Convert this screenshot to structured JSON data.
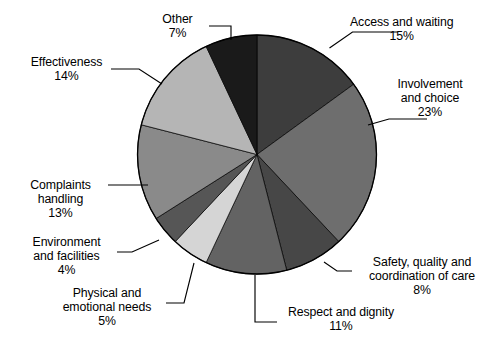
{
  "chart_data": {
    "type": "pie",
    "title": "",
    "subtitle": "",
    "xlabel": "",
    "ylabel": "",
    "legend_position": "none",
    "labels_position": "outside-with-leader-lines",
    "grid": false,
    "start_angle_deg": 0,
    "direction": "clockwise",
    "units": "percent",
    "total": 100,
    "categories": [
      "Access and waiting",
      "Involvement and choice",
      "Safety, quality and coordination of care",
      "Respect and dignity",
      "Physical and emotional needs",
      "Environment and facilities",
      "Complaints handling",
      "Effectiveness",
      "Other"
    ],
    "values": [
      15,
      23,
      8,
      11,
      5,
      4,
      13,
      14,
      7
    ],
    "colors": [
      "#3d3d3d",
      "#6e6e6e",
      "#474747",
      "#636363",
      "#d5d5d5",
      "#565656",
      "#8a8a8a",
      "#b5b5b5",
      "#1a1a1a"
    ],
    "slices": [
      {
        "label": "Access and waiting",
        "value": 15,
        "value_text": "15%",
        "color": "#3d3d3d"
      },
      {
        "label": "Involvement and choice",
        "value": 23,
        "value_text": "23%",
        "color": "#6e6e6e"
      },
      {
        "label": "Safety, quality and coordination of care",
        "value": 8,
        "value_text": "8%",
        "color": "#474747"
      },
      {
        "label": "Respect and dignity",
        "value": 11,
        "value_text": "11%",
        "color": "#636363"
      },
      {
        "label": "Physical and emotional needs",
        "value": 5,
        "value_text": "5%",
        "color": "#d5d5d5"
      },
      {
        "label": "Environment and facilities",
        "value": 4,
        "value_text": "4%",
        "color": "#565656"
      },
      {
        "label": "Complaints handling",
        "value": 13,
        "value_text": "13%",
        "color": "#8a8a8a"
      },
      {
        "label": "Effectiveness",
        "value": 14,
        "value_text": "14%",
        "color": "#b5b5b5"
      },
      {
        "label": "Other",
        "value": 7,
        "value_text": "7%",
        "color": "#1a1a1a"
      }
    ]
  },
  "labels": {
    "access": {
      "line1": "Access and waiting",
      "pct": "15%"
    },
    "involvement": {
      "line1": "Involvement",
      "line2": "and choice",
      "pct": "23%"
    },
    "safety": {
      "line1": "Safety, quality and",
      "line2": "coordination of care",
      "pct": "8%"
    },
    "respect": {
      "line1": "Respect and dignity",
      "pct": "11%"
    },
    "physical": {
      "line1": "Physical and",
      "line2": "emotional needs",
      "pct": "5%"
    },
    "environment": {
      "line1": "Environment",
      "line2": "and facilities",
      "pct": "4%"
    },
    "complaints": {
      "line1": "Complaints",
      "line2": "handling",
      "pct": "13%"
    },
    "effectiveness": {
      "line1": "Effectiveness",
      "pct": "14%"
    },
    "other": {
      "line1": "Other",
      "pct": "7%"
    }
  }
}
